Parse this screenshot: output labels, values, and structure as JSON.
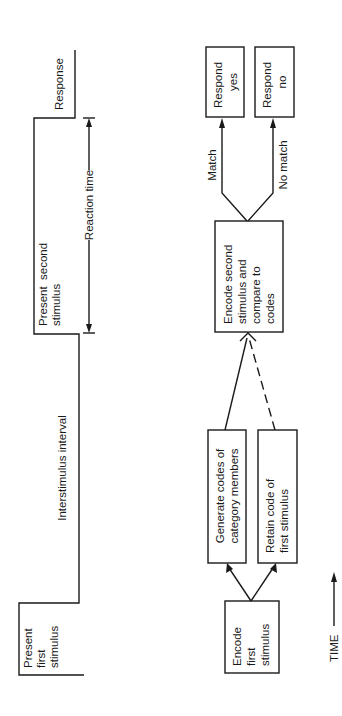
{
  "timeline": {
    "present_first": [
      "Present",
      "first",
      "stimulus"
    ],
    "interstimulus": "Interstimulus interval",
    "present_second": [
      "Present  second",
      "stimulus"
    ],
    "reaction_time": "Reaction time",
    "response": "Response"
  },
  "flow": {
    "encode_first": [
      "Encode",
      "first",
      "stimulus"
    ],
    "generate_codes": [
      "Generate codes of",
      "category members"
    ],
    "retain_code": [
      "Retain code of",
      "first stimulus"
    ],
    "encode_second": [
      "Encode second",
      "stimulus and",
      "compare to",
      "codes"
    ],
    "match_label": "Match",
    "no_match_label": "No match",
    "respond_yes": [
      "Respond",
      "yes"
    ],
    "respond_no": [
      "Respond",
      "no"
    ]
  },
  "time_axis": {
    "label": "TIME"
  },
  "colors": {
    "ink": "#1a1a1a",
    "background": "#ffffff"
  }
}
